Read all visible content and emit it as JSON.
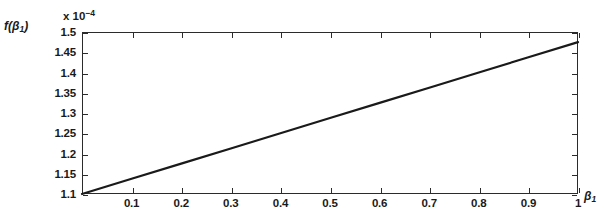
{
  "chart_data": {
    "type": "line",
    "title": "",
    "subtitle": "",
    "xlabel": "β₁",
    "ylabel": "f(β₁)",
    "y_exponent_label": "x 10",
    "y_exponent_value": "−4",
    "y_scale_factor": 0.0001,
    "xlim": [
      0,
      1
    ],
    "ylim": [
      1.1,
      1.5
    ],
    "grid": false,
    "legend": null,
    "legend_position": "none",
    "xticks": [
      0.1,
      0.2,
      0.3,
      0.4,
      0.5,
      0.6,
      0.7,
      0.8,
      0.9,
      1
    ],
    "xtick_labels": [
      "0.1",
      "0.2",
      "0.3",
      "0.4",
      "0.5",
      "0.6",
      "0.7",
      "0.8",
      "0.9",
      "1"
    ],
    "yticks": [
      1.1,
      1.15,
      1.2,
      1.25,
      1.3,
      1.35,
      1.4,
      1.45,
      1.5
    ],
    "ytick_labels": [
      "1.1",
      "1.15",
      "1.2",
      "1.25",
      "1.3",
      "1.35",
      "1.4",
      "1.45",
      "1.5"
    ],
    "series": [
      {
        "name": "f(β₁)",
        "color": "#1a1a1a",
        "line_width": 2.2,
        "x": [
          0,
          0.1,
          0.2,
          0.3,
          0.4,
          0.5,
          0.6,
          0.7,
          0.8,
          0.9,
          1
        ],
        "values": [
          1.1,
          1.1375,
          1.175,
          1.2125,
          1.25,
          1.2875,
          1.325,
          1.3625,
          1.4,
          1.4375,
          1.475
        ]
      }
    ]
  },
  "axes": {
    "frame_color": "#2b2b2b",
    "background": "#ffffff",
    "tick_direction": "in",
    "box": true
  }
}
